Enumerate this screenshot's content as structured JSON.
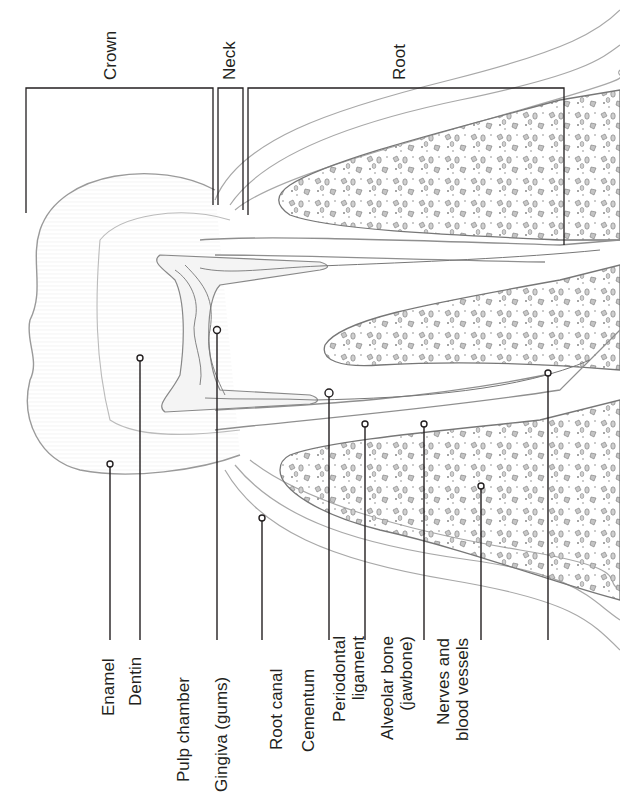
{
  "diagram": {
    "orientation": "rotated 90 degrees counter-clockwise",
    "colors": {
      "line": "#231f20",
      "outline": "#8a8a8a",
      "bone_fill": "#bdbdbd",
      "background": "#ffffff"
    },
    "regions": [
      {
        "id": "crown",
        "label": "Crown"
      },
      {
        "id": "neck",
        "label": "Neck"
      },
      {
        "id": "root",
        "label": "Root"
      }
    ],
    "labels": [
      {
        "id": "enamel",
        "text": "Enamel"
      },
      {
        "id": "dentin",
        "text": "Dentin"
      },
      {
        "id": "pulp-chamber",
        "text": "Pulp chamber"
      },
      {
        "id": "gingiva",
        "text": "Gingiva (gums)"
      },
      {
        "id": "root-canal",
        "text": "Root canal"
      },
      {
        "id": "cementum",
        "text": "Cementum"
      },
      {
        "id": "periodontal-ligament",
        "line1": "Periodontal",
        "line2": "ligament"
      },
      {
        "id": "alveolar-bone",
        "line1": "Alveolar bone",
        "line2": "(jawbone)"
      },
      {
        "id": "nerves-vessels",
        "line1": "Nerves and",
        "line2": "blood vessels"
      }
    ]
  }
}
